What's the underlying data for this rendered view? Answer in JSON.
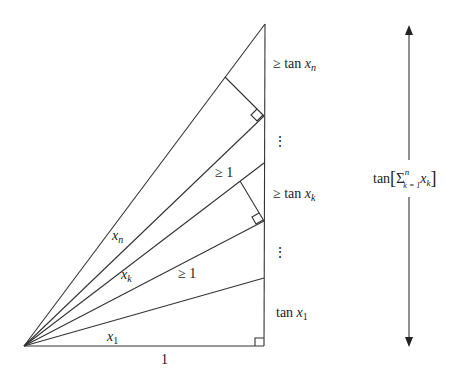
{
  "figure": {
    "origin": [
      24,
      346
    ],
    "right_x": 264,
    "apex_y": 24,
    "rays": [
      {
        "name": "ray-1",
        "end_y": 278
      },
      {
        "name": "ray-2",
        "end_y": 221
      },
      {
        "name": "ray-3",
        "end_y": 163
      },
      {
        "name": "ray-4",
        "end_y": 116
      },
      {
        "name": "ray-n",
        "end_y": 24
      }
    ]
  },
  "labels": {
    "base": "1",
    "angle_x1": "x",
    "angle_x1_sub": "1",
    "angle_xk": "x",
    "angle_xk_sub": "k",
    "angle_xn": "x",
    "angle_xn_sub": "n",
    "geq_one_lower": "≥ 1",
    "geq_one_upper": "≥ 1",
    "tan_x1_prefix": "tan ",
    "tan_x1_var": "x",
    "tan_x1_sub": "1",
    "geq_tan_xk_prefix": "≥ tan ",
    "geq_tan_xk_var": "x",
    "geq_tan_xk_sub": "k",
    "geq_tan_xn_prefix": "≥ tan ",
    "geq_tan_xn_var": "x",
    "geq_tan_xn_sub": "n",
    "vdots": "⋮",
    "total_prefix": "tan",
    "total_sigma": "Σ",
    "total_sup": "n",
    "total_sub": "k = 1",
    "total_var": "x",
    "total_var_sub": "k",
    "bracket_open": "[",
    "bracket_close": "]"
  },
  "colors": {
    "stroke": "#333333",
    "text": "#222222",
    "background": "#ffffff"
  }
}
